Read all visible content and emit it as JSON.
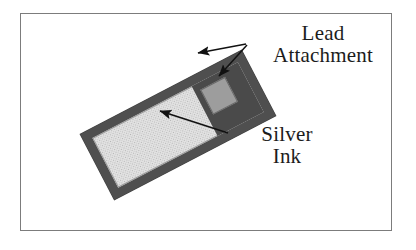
{
  "figure": {
    "title": "",
    "background_color": "#ffffff",
    "frame": {
      "border_color": "#7c7c7c",
      "fill_color": "#ffffff"
    }
  },
  "device": {
    "name": "silver-ink-strip",
    "rotation_degrees": -27.5,
    "substrate_color": "#4f4f4f",
    "silver_ink_color": "#e2e2e2",
    "lead_pad_color": "#4a4a4a",
    "lead_window_color": "#9d9d9d"
  },
  "annotations": {
    "lead": {
      "line1": "Lead",
      "line2": "Attachment",
      "pointer_count": 2,
      "color": "#1c1c1c"
    },
    "silver": {
      "line1": "Silver",
      "line2": "Ink",
      "pointer_count": 1,
      "color": "#1c1c1c"
    }
  }
}
